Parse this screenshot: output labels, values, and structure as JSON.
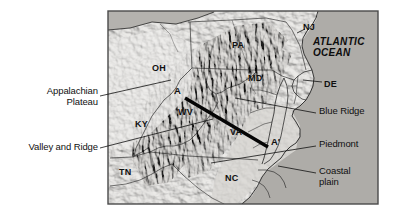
{
  "figure": {
    "kind": "shaded-relief-map",
    "region": "Central Appalachian Mountains and Atlantic Coast, eastern United States",
    "frame": {
      "x": 108,
      "y": 11,
      "width": 270,
      "height": 193
    },
    "background_color": "#ffffff",
    "land_color": "#c8c6c1",
    "ocean_color": "#aaa8a4",
    "frame_color": "#4a4a4a",
    "line_color": "#111111"
  },
  "ocean_label": "ATLANTIC\nOCEAN",
  "states": [
    {
      "code": "OH",
      "x": 156,
      "y": 68
    },
    {
      "code": "PA",
      "x": 236,
      "y": 45
    },
    {
      "code": "NJ",
      "x": 307,
      "y": 27
    },
    {
      "code": "MD",
      "x": 254,
      "y": 78
    },
    {
      "code": "DE",
      "x": 325,
      "y": 84
    },
    {
      "code": "WV",
      "x": 183,
      "y": 112
    },
    {
      "code": "KY",
      "x": 140,
      "y": 124
    },
    {
      "code": "VA",
      "x": 235,
      "y": 132
    },
    {
      "code": "TN",
      "x": 124,
      "y": 172
    },
    {
      "code": "NC",
      "x": 230,
      "y": 178
    }
  ],
  "cross_section": {
    "label_start": "A",
    "label_end": "A′",
    "start_point": {
      "x": 185,
      "y": 98
    },
    "end_point": {
      "x": 268,
      "y": 147
    },
    "start_label_pos": {
      "x": 176,
      "y": 91
    },
    "end_label_pos": {
      "x": 272,
      "y": 143
    },
    "line_width": 3.4
  },
  "callouts": [
    {
      "id": "appalachian-plateau",
      "label": "Appalachian\nPlateau",
      "side": "left",
      "text_pos": {
        "x": 98,
        "y": 91
      },
      "leader": [
        [
          100,
          96
        ],
        [
          171,
          80
        ]
      ]
    },
    {
      "id": "valley-and-ridge",
      "label": "Valley and Ridge",
      "side": "left",
      "text_pos": {
        "x": 98,
        "y": 144
      },
      "leader": [
        [
          100,
          148
        ],
        [
          213,
          119
        ]
      ]
    },
    {
      "id": "blue-ridge",
      "label": "Blue Ridge",
      "side": "right",
      "text_pos": {
        "x": 318,
        "y": 110
      },
      "leader": [
        [
          316,
          113
        ],
        [
          235,
          98
        ]
      ]
    },
    {
      "id": "piedmont",
      "label": "Piedmont",
      "side": "right",
      "text_pos": {
        "x": 318,
        "y": 143
      },
      "leader": [
        [
          316,
          146
        ],
        [
          211,
          163
        ]
      ]
    },
    {
      "id": "coastal-plain",
      "label": "Coastal\nplain",
      "side": "right",
      "text_pos": {
        "x": 318,
        "y": 170
      },
      "leader": [
        [
          316,
          173
        ],
        [
          278,
          166
        ]
      ]
    },
    {
      "id": "delaware",
      "label": "DE",
      "side": "right-inline",
      "text_pos": {
        "x": 325,
        "y": 84
      },
      "leader": [
        [
          322,
          86
        ],
        [
          303,
          82
        ]
      ]
    },
    {
      "id": "new-jersey",
      "label": "NJ",
      "side": "inline",
      "text_pos": {
        "x": 307,
        "y": 27
      },
      "leader": [
        [
          305,
          30
        ],
        [
          296,
          34
        ]
      ]
    }
  ]
}
